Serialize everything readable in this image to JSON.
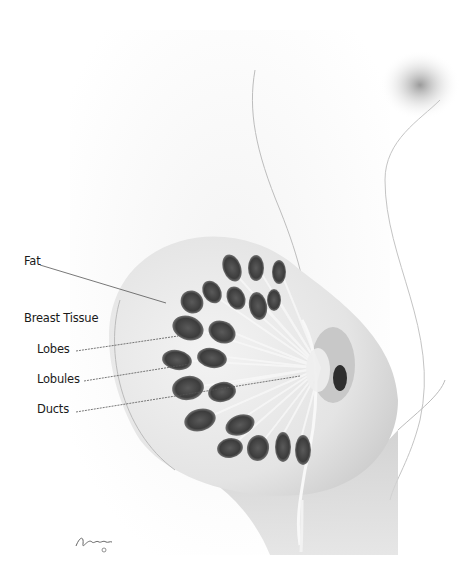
{
  "diagram": {
    "labels": [
      {
        "id": "fat",
        "text": "Fat",
        "x": 24,
        "y": 258,
        "line": [
          39,
          265,
          166,
          303
        ]
      },
      {
        "id": "breast-tissue",
        "text": "Breast Tissue",
        "x": 24,
        "y": 315,
        "line": null
      },
      {
        "id": "lobes",
        "text": "Lobes",
        "x": 37,
        "y": 346,
        "line": [
          75,
          351,
          178,
          336
        ]
      },
      {
        "id": "lobules",
        "text": "Lobules",
        "x": 37,
        "y": 376,
        "line": [
          84,
          381,
          178,
          364
        ]
      },
      {
        "id": "ducts",
        "text": "Ducts",
        "x": 37,
        "y": 406,
        "line": [
          75,
          412,
          300,
          376
        ]
      }
    ],
    "signature": "signature",
    "colors": {
      "lobe": "#3a3a3a",
      "tissue": "#d8d8d8",
      "line": "#555555",
      "text": "#1a1a1a"
    }
  }
}
